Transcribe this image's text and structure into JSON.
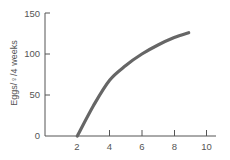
{
  "chart_data": {
    "type": "line",
    "title": "",
    "xlabel": "",
    "ylabel": "Eggs/♀/4 weeks",
    "xlim": [
      0,
      10
    ],
    "ylim": [
      0,
      150
    ],
    "x_ticks": [
      "2",
      "4",
      "6",
      "8",
      "10"
    ],
    "y_ticks": [
      "0",
      "50",
      "100",
      "150"
    ],
    "grid": false,
    "legend": null,
    "series": [
      {
        "name": "eggs",
        "color": "#666666",
        "x": [
          2,
          3,
          4,
          5,
          6,
          7,
          8,
          8.9
        ],
        "values": [
          0,
          37,
          68,
          86,
          100,
          111,
          120,
          126
        ]
      }
    ]
  },
  "colors": {
    "axis": "#555555",
    "curve": "#666666"
  }
}
